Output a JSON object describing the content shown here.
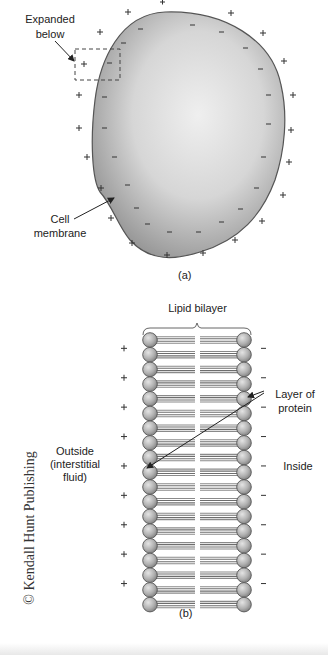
{
  "figure_a": {
    "label_expanded": "Expanded",
    "label_below": "below",
    "label_cell": "Cell",
    "label_membrane": "membrane",
    "caption": "(a)",
    "outside_charge": "+",
    "inside_charge": "−"
  },
  "figure_b": {
    "title": "Lipid bilayer",
    "label_layer_of": "Layer of",
    "label_protein": "protein",
    "label_outside": "Outside",
    "label_interstitial": "(interstitial",
    "label_fluid": "fluid)",
    "label_inside": "Inside",
    "caption": "(b)",
    "row_count": 19,
    "outside_charge": "+",
    "inside_charge": "−"
  },
  "credit": "© Kendall Hunt Publishing",
  "colors": {
    "cell_fill_center": "#ededed",
    "cell_fill_edge": "#9a9a9a",
    "membrane_stroke": "#555555",
    "head_fill": "#b5b5b5",
    "tail_stroke": "#777777"
  }
}
